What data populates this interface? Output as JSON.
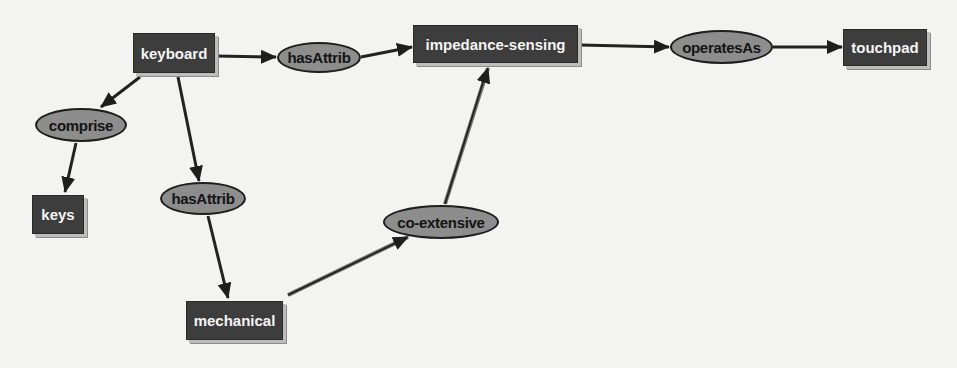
{
  "diagram": {
    "type": "concept-map",
    "colors": {
      "background": "#f3f3f1",
      "concept_fill": "#3d3d3d",
      "concept_text": "#f4f4f4",
      "relation_fill": "#8d8d8d",
      "relation_text": "#141414",
      "edge": "#222222"
    },
    "concepts": {
      "keyboard": "keyboard",
      "impedance_sensing": "impedance-sensing",
      "touchpad": "touchpad",
      "keys": "keys",
      "mechanical": "mechanical"
    },
    "relations": {
      "has_attrib_1": "hasAttrib",
      "operates_as": "operatesAs",
      "comprise": "comprise",
      "has_attrib_2": "hasAttrib",
      "co_extensive": "co-extensive"
    },
    "edges": [
      {
        "from": "keyboard",
        "to": "hasAttrib"
      },
      {
        "from": "hasAttrib",
        "to": "impedance-sensing"
      },
      {
        "from": "impedance-sensing",
        "to": "operatesAs"
      },
      {
        "from": "operatesAs",
        "to": "touchpad"
      },
      {
        "from": "keyboard",
        "to": "comprise"
      },
      {
        "from": "comprise",
        "to": "keys"
      },
      {
        "from": "keyboard",
        "to": "hasAttrib"
      },
      {
        "from": "hasAttrib",
        "to": "mechanical"
      },
      {
        "from": "mechanical",
        "to": "co-extensive"
      },
      {
        "from": "co-extensive",
        "to": "impedance-sensing"
      }
    ]
  }
}
